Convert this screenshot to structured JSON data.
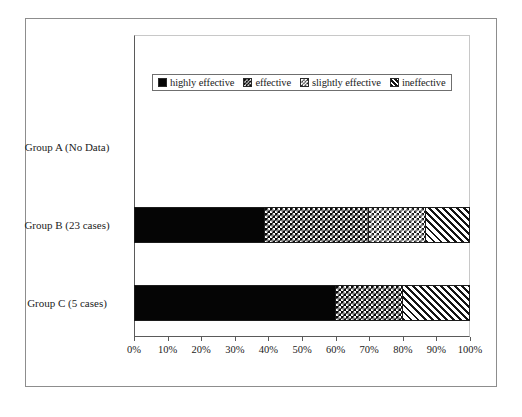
{
  "chart_data": {
    "type": "bar",
    "orientation": "horizontal",
    "stacked": true,
    "normalized": true,
    "title": "",
    "subtitle": "",
    "xlabel": "",
    "ylabel": "",
    "xlim": [
      0,
      100
    ],
    "xtick_labels": [
      "0%",
      "10%",
      "20%",
      "30%",
      "40%",
      "50%",
      "60%",
      "70%",
      "80%",
      "90%",
      "100%"
    ],
    "xtick_values": [
      0,
      10,
      20,
      30,
      40,
      50,
      60,
      70,
      80,
      90,
      100
    ],
    "grid": false,
    "legend_position": "top-center",
    "categories": [
      "Group A (No Data)",
      "Group B (23 cases)",
      "Group C (5 cases)"
    ],
    "series": [
      {
        "name": "highly effective",
        "pattern": "solid-black",
        "color": "#050505",
        "values": [
          0,
          39,
          60
        ]
      },
      {
        "name": "effective",
        "pattern": "dark-checkerboard",
        "color": "#0a0a0a",
        "values": [
          0,
          31,
          20
        ]
      },
      {
        "name": "slightly effective",
        "pattern": "light-checkerboard",
        "color": "#c8c8c8",
        "values": [
          0,
          17,
          0
        ]
      },
      {
        "name": "ineffective",
        "pattern": "diagonal-hatch",
        "color": "#ffffff",
        "values": [
          0,
          13,
          20
        ]
      }
    ]
  },
  "legend": {
    "entries": [
      {
        "label": "highly effective",
        "swatch": "solid-black-swatch"
      },
      {
        "label": "effective",
        "swatch": "dark-checkerboard-swatch"
      },
      {
        "label": "slightly effective",
        "swatch": "light-checkerboard-swatch"
      },
      {
        "label": "ineffective",
        "swatch": "diagonal-hatch-swatch"
      }
    ]
  },
  "axis": {
    "y_labels": [
      "Group A (No Data)",
      "Group B (23 cases)",
      "Group C (5 cases)"
    ],
    "x_labels": [
      "0%",
      "10%",
      "20%",
      "30%",
      "40%",
      "50%",
      "60%",
      "70%",
      "80%",
      "90%",
      "100%"
    ]
  },
  "colors": {
    "frame": "#8d8d8d",
    "axis": "#5a5a5a",
    "text": "#222222",
    "background": "#ffffff"
  }
}
